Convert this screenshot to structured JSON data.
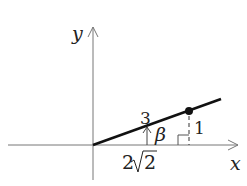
{
  "diagram": {
    "axes": {
      "x_label": "x",
      "y_label": "y"
    },
    "labels": {
      "hypotenuse": "3",
      "angle": "β",
      "opposite": "1",
      "adjacent_prefix": "2",
      "adjacent_radical": "2"
    },
    "colors": {
      "line": "#111111",
      "axis": "#777777",
      "text": "#222222"
    }
  }
}
